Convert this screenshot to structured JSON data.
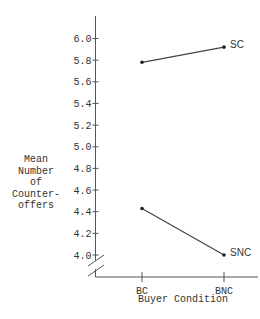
{
  "chart_data": {
    "type": "line",
    "title": "",
    "xlabel": "Buyer Condition",
    "ylabel": [
      "Mean",
      "Number",
      "of",
      "Counter-",
      "offers"
    ],
    "categories": [
      "BC",
      "BNC"
    ],
    "y_ticks": [
      "4.0",
      "4.2",
      "4.4",
      "4.6",
      "4.8",
      "5.0",
      "5.2",
      "5.4",
      "5.6",
      "5.8",
      "6.0"
    ],
    "ylim": [
      4.0,
      6.0
    ],
    "axis_break": true,
    "grid": false,
    "legend": "none (series labeled at line ends, right side)",
    "series": [
      {
        "name": "SC",
        "values": [
          5.78,
          5.92
        ]
      },
      {
        "name": "SNC",
        "values": [
          4.43,
          4.0
        ]
      }
    ]
  }
}
